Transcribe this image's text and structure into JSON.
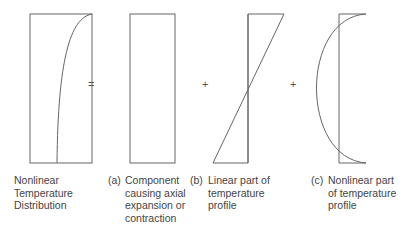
{
  "operators": [
    "=",
    "+",
    "+"
  ],
  "panels": [
    {
      "tag": "",
      "lines": [
        "Nonlinear",
        "Temperature",
        "Distribution"
      ]
    },
    {
      "tag": "(a)",
      "lines": [
        "Component",
        "causing axial",
        "expansion or",
        "contraction"
      ]
    },
    {
      "tag": "(b)",
      "lines": [
        "Linear part of",
        "temperature",
        "profile"
      ]
    },
    {
      "tag": "(c)",
      "lines": [
        "Nonlinear part",
        "of temperature",
        "profile"
      ]
    }
  ],
  "colors": {
    "stroke": "#555555",
    "text": "#444444"
  }
}
